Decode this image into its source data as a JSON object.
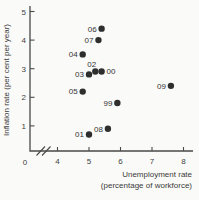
{
  "chart_data": {
    "type": "scatter",
    "title": "",
    "xlabel": "Unemployment rate",
    "xlabel_line2": "(percentage of workforce)",
    "ylabel": "Inflation rate (per cent per year)",
    "origin_label": "0",
    "x_ticks": [
      4,
      5,
      6,
      7,
      8
    ],
    "y_ticks": [
      1,
      2,
      3,
      4,
      5
    ],
    "xlim": [
      4,
      8.3
    ],
    "ylim": [
      0,
      5.2
    ],
    "grid": false,
    "axis_break_x": true,
    "legend": "none",
    "point_color": "#2e2e2e",
    "axis_color": "#4a4a4a",
    "text_color": "#3f3f3f",
    "background_color": "#fafaf8",
    "points": [
      {
        "label": "99",
        "x": 5.9,
        "y": 1.8,
        "label_pos": "left"
      },
      {
        "label": "00",
        "x": 5.4,
        "y": 2.9,
        "label_pos": "right"
      },
      {
        "label": "01",
        "x": 5.0,
        "y": 0.7,
        "label_pos": "left"
      },
      {
        "label": "02",
        "x": 5.2,
        "y": 2.9,
        "label_pos": "above"
      },
      {
        "label": "03",
        "x": 5.0,
        "y": 2.8,
        "label_pos": "left"
      },
      {
        "label": "04",
        "x": 4.8,
        "y": 3.5,
        "label_pos": "left"
      },
      {
        "label": "05",
        "x": 4.8,
        "y": 2.2,
        "label_pos": "left"
      },
      {
        "label": "06",
        "x": 5.4,
        "y": 4.4,
        "label_pos": "left"
      },
      {
        "label": "07",
        "x": 5.3,
        "y": 4.0,
        "label_pos": "left"
      },
      {
        "label": "08",
        "x": 5.6,
        "y": 0.9,
        "label_pos": "left"
      },
      {
        "label": "09",
        "x": 7.6,
        "y": 2.4,
        "label_pos": "left"
      }
    ]
  }
}
